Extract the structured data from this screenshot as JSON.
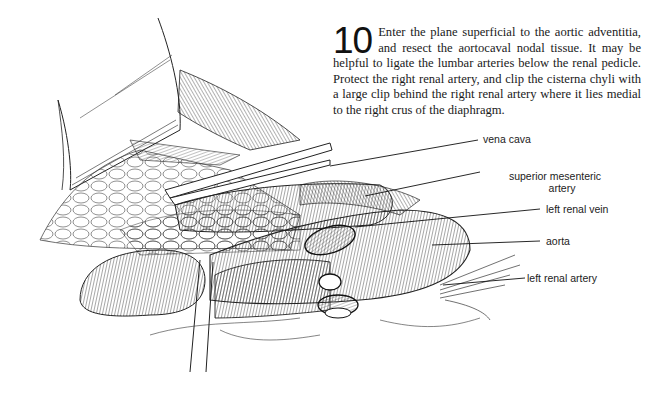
{
  "step": {
    "number": "10",
    "text": "Enter the plane superficial to the aortic adventitia, and resect the aortocaval nodal tissue. It may be helpful to ligate the lumbar arteries below the renal pedicle. Protect the right renal artery, and clip the cisterna chyli with a large clip behind the right renal artery where it lies medial to the right crus of the diaphragm."
  },
  "figure": {
    "labels": {
      "vena_cava": "vena cava",
      "superior_mesenteric_line1": "superior mesenteric",
      "superior_mesenteric_line2": "artery",
      "left_renal_vein": "left renal vein",
      "aorta": "aorta",
      "left_renal_artery": "left renal artery"
    },
    "colors": {
      "ink": "#1a1a1a",
      "background": "#ffffff"
    }
  }
}
